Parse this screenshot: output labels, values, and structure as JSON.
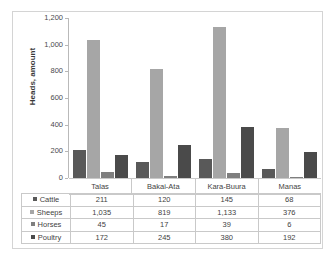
{
  "chart_data": {
    "type": "bar",
    "title": "",
    "subtitle": "",
    "xlabel": "",
    "ylabel": "Heads, amount",
    "ylim": [
      0,
      1200
    ],
    "ytick_step": 200,
    "yticks": [
      "0",
      "200",
      "400",
      "600",
      "800",
      "1,000",
      "1,200"
    ],
    "ytick_values": [
      0,
      200,
      400,
      600,
      800,
      1000,
      1200
    ],
    "grid": false,
    "legend_position": "data-table-left",
    "categories": [
      "Talas",
      "Bakai-Ata",
      "Kara-Buura",
      "Manas"
    ],
    "series": [
      {
        "name": "Cattle",
        "color": "#595959",
        "values": [
          211,
          120,
          145,
          68
        ],
        "labels": [
          "211",
          "120",
          "145",
          "68"
        ]
      },
      {
        "name": "Sheeps",
        "color": "#a6a6a6",
        "values": [
          1035,
          819,
          1133,
          376
        ],
        "labels": [
          "1,035",
          "819",
          "1,133",
          "376"
        ]
      },
      {
        "name": "Horses",
        "color": "#7f7f7f",
        "values": [
          45,
          17,
          39,
          6
        ],
        "labels": [
          "45",
          "17",
          "39",
          "6"
        ]
      },
      {
        "name": "Poultry",
        "color": "#4a4a4a",
        "values": [
          172,
          245,
          380,
          192
        ],
        "labels": [
          "172",
          "245",
          "380",
          "192"
        ]
      }
    ]
  },
  "table": {
    "corner_label": "",
    "column_headers": [
      "Talas",
      "Bakai-Ata",
      "Kara-Buura",
      "Manas"
    ],
    "rows": [
      {
        "label": "Cattle",
        "cells": [
          "211",
          "120",
          "145",
          "68"
        ]
      },
      {
        "label": "Sheeps",
        "cells": [
          "1,035",
          "819",
          "1,133",
          "376"
        ]
      },
      {
        "label": "Horses",
        "cells": [
          "45",
          "17",
          "39",
          "6"
        ]
      },
      {
        "label": "Poultry",
        "cells": [
          "172",
          "245",
          "380",
          "192"
        ]
      }
    ]
  },
  "colors": {
    "cattle": "#595959",
    "sheeps": "#a6a6a6",
    "horses": "#7f7f7f",
    "poultry": "#4a4a4a",
    "border": "#c9c9c9",
    "axis": "#b9b9b9",
    "text": "#3f3f3f",
    "background": "#ffffff"
  }
}
